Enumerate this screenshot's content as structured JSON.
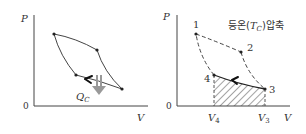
{
  "left_diagram": {
    "y_axis_label": "P",
    "x_axis_label": "V",
    "origin_label": "0",
    "heat_label_main": "Q",
    "heat_label_sub": "C",
    "points": [
      {
        "x": 54,
        "y": 34
      },
      {
        "x": 97,
        "y": 50
      },
      {
        "x": 122,
        "y": 89
      },
      {
        "x": 76,
        "y": 75
      }
    ],
    "heat_arrow_color": "#999999"
  },
  "right_diagram": {
    "y_axis_label": "P",
    "x_axis_label": "V",
    "origin_label": "0",
    "title_prefix": "등온(",
    "title_T": "T",
    "title_T_sub": "C",
    "title_suffix": ")압축",
    "point_labels": [
      "1",
      "2",
      "3",
      "4"
    ],
    "v4_main": "V",
    "v4_sub": "4",
    "v3_main": "V",
    "v3_sub": "3"
  }
}
